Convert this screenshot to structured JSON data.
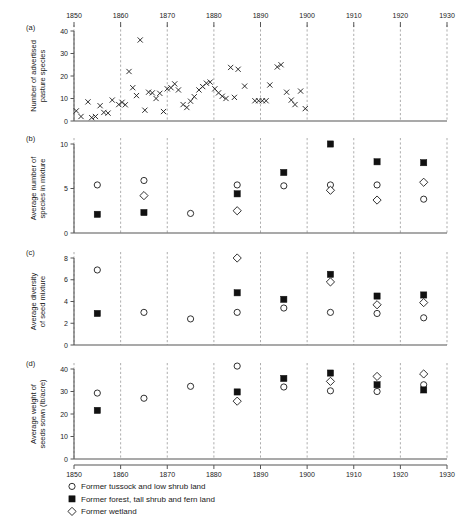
{
  "figure": {
    "panels": [
      "(a)",
      "(b)",
      "(c)",
      "(d)"
    ],
    "x_axis": {
      "label": "",
      "min": 1850,
      "max": 1930,
      "ticks": [
        1850,
        1860,
        1870,
        1880,
        1890,
        1900,
        1910,
        1920,
        1930
      ],
      "tick_labels": [
        "1850",
        "1860",
        "1870",
        "1880",
        "1890",
        "1900",
        "1910",
        "1920",
        "1930"
      ],
      "top_axis": true,
      "bottom_axis": true,
      "gridlines": "dashed vertical at every decade"
    },
    "legend": {
      "position": "below-bottom-axis",
      "entries": [
        {
          "marker": "open-circle",
          "label": "Former tussock and low shrub land"
        },
        {
          "marker": "filled-square",
          "label": "Former forest, tall shrub and fern land"
        },
        {
          "marker": "open-diamond",
          "label": "Former wetland"
        }
      ]
    }
  },
  "chart_data": [
    {
      "type": "scatter",
      "panel": "(a)",
      "title": "",
      "xlabel": "",
      "ylabel": "Number of advertised pasture species",
      "xlim": [
        1850,
        1930
      ],
      "ylim": [
        0,
        40
      ],
      "yticks": [
        0,
        10,
        20,
        30,
        40
      ],
      "ytick_labels": [
        "0",
        "10",
        "20",
        "30",
        "40"
      ],
      "grid": "vertical dashed decade lines",
      "legend": "none",
      "series": [
        {
          "name": "Advertised pasture species",
          "marker": "cross",
          "points": [
            [
              1850.5,
              4.5
            ],
            [
              1851.5,
              2.0
            ],
            [
              1853.0,
              8.5
            ],
            [
              1853.8,
              1.5
            ],
            [
              1854.6,
              2.0
            ],
            [
              1855.6,
              6.8
            ],
            [
              1856.4,
              3.8
            ],
            [
              1857.3,
              3.5
            ],
            [
              1858.2,
              9.3
            ],
            [
              1859.6,
              7.3
            ],
            [
              1860.3,
              8.3
            ],
            [
              1861.0,
              7.2
            ],
            [
              1861.8,
              22.0
            ],
            [
              1862.6,
              14.8
            ],
            [
              1863.4,
              11.3
            ],
            [
              1864.2,
              36.0
            ],
            [
              1865.2,
              4.8
            ],
            [
              1866.0,
              12.8
            ],
            [
              1866.8,
              12.5
            ],
            [
              1867.6,
              10.0
            ],
            [
              1868.4,
              12.3
            ],
            [
              1869.2,
              4.2
            ],
            [
              1870.0,
              14.3
            ],
            [
              1870.8,
              14.8
            ],
            [
              1871.6,
              16.5
            ],
            [
              1872.4,
              13.8
            ],
            [
              1873.4,
              7.3
            ],
            [
              1874.2,
              6.0
            ],
            [
              1875.0,
              8.8
            ],
            [
              1875.8,
              10.8
            ],
            [
              1876.8,
              13.8
            ],
            [
              1877.6,
              15.3
            ],
            [
              1878.4,
              16.8
            ],
            [
              1879.2,
              17.3
            ],
            [
              1880.2,
              14.3
            ],
            [
              1881.0,
              12.5
            ],
            [
              1881.8,
              11.0
            ],
            [
              1882.6,
              10.0
            ],
            [
              1883.6,
              23.8
            ],
            [
              1884.4,
              10.5
            ],
            [
              1885.2,
              23.0
            ],
            [
              1886.6,
              15.5
            ],
            [
              1888.8,
              9.0
            ],
            [
              1889.6,
              9.0
            ],
            [
              1890.4,
              9.0
            ],
            [
              1891.2,
              9.0
            ],
            [
              1892.0,
              16.0
            ],
            [
              1893.6,
              24.0
            ],
            [
              1894.4,
              25.0
            ],
            [
              1895.6,
              12.8
            ],
            [
              1896.6,
              9.3
            ],
            [
              1897.4,
              7.3
            ],
            [
              1898.6,
              13.3
            ],
            [
              1899.6,
              5.5
            ]
          ]
        }
      ]
    },
    {
      "type": "scatter",
      "panel": "(b)",
      "title": "",
      "xlabel": "",
      "ylabel": "Average number of species in mixture",
      "xlim": [
        1850,
        1930
      ],
      "ylim": [
        0,
        10
      ],
      "yticks": [
        0,
        5,
        10
      ],
      "ytick_labels": [
        "0",
        "5",
        "10"
      ],
      "grid": "vertical dashed decade lines",
      "series": [
        {
          "name": "Former tussock and low shrub land",
          "marker": "open-circle",
          "points": [
            [
              1855,
              5.4
            ],
            [
              1865,
              5.9
            ],
            [
              1875,
              2.2
            ],
            [
              1885,
              5.4
            ],
            [
              1895,
              5.3
            ],
            [
              1905,
              5.4
            ],
            [
              1915,
              5.4
            ],
            [
              1925,
              3.8
            ]
          ]
        },
        {
          "name": "Former forest, tall shrub and fern land",
          "marker": "filled-square",
          "points": [
            [
              1855,
              2.1
            ],
            [
              1865,
              2.3
            ],
            [
              1885,
              4.4
            ],
            [
              1895,
              6.8
            ],
            [
              1905,
              10.0
            ],
            [
              1915,
              8.0
            ],
            [
              1925,
              7.9
            ]
          ]
        },
        {
          "name": "Former wetland",
          "marker": "open-diamond",
          "points": [
            [
              1865,
              4.2
            ],
            [
              1885,
              2.5
            ],
            [
              1905,
              4.8
            ],
            [
              1915,
              3.7
            ],
            [
              1925,
              5.7
            ]
          ]
        }
      ]
    },
    {
      "type": "scatter",
      "panel": "(c)",
      "title": "",
      "xlabel": "",
      "ylabel": "Average diversity of seed mixture",
      "xlim": [
        1850,
        1930
      ],
      "ylim": [
        0,
        8
      ],
      "yticks": [
        0,
        2,
        4,
        6,
        8
      ],
      "ytick_labels": [
        "0",
        "2",
        "4",
        "6",
        "8"
      ],
      "grid": "vertical dashed decade lines",
      "series": [
        {
          "name": "Former tussock and low shrub land",
          "marker": "open-circle",
          "points": [
            [
              1855,
              6.9
            ],
            [
              1865,
              3.0
            ],
            [
              1875,
              2.4
            ],
            [
              1885,
              3.0
            ],
            [
              1895,
              3.4
            ],
            [
              1905,
              3.0
            ],
            [
              1915,
              2.9
            ],
            [
              1925,
              2.5
            ]
          ]
        },
        {
          "name": "Former forest, tall shrub and fern land",
          "marker": "filled-square",
          "points": [
            [
              1855,
              2.9
            ],
            [
              1885,
              4.8
            ],
            [
              1895,
              4.2
            ],
            [
              1905,
              6.5
            ],
            [
              1915,
              4.5
            ],
            [
              1925,
              4.6
            ]
          ]
        },
        {
          "name": "Former wetland",
          "marker": "open-diamond",
          "points": [
            [
              1885,
              8.0
            ],
            [
              1905,
              5.8
            ],
            [
              1915,
              3.7
            ],
            [
              1925,
              3.9
            ]
          ]
        }
      ]
    },
    {
      "type": "scatter",
      "panel": "(d)",
      "title": "",
      "xlabel": "",
      "ylabel": "Average weight of seeds sown (lb/acre)",
      "xlim": [
        1850,
        1930
      ],
      "ylim": [
        0,
        40
      ],
      "yticks": [
        0,
        10,
        20,
        30,
        40
      ],
      "ytick_labels": [
        "0",
        "10",
        "20",
        "30",
        "40"
      ],
      "grid": "vertical dashed decade lines",
      "series": [
        {
          "name": "Former tussock and low shrub land",
          "marker": "open-circle",
          "points": [
            [
              1855,
              29.3
            ],
            [
              1865,
              27.0
            ],
            [
              1875,
              32.3
            ],
            [
              1885,
              41.3
            ],
            [
              1895,
              32.0
            ],
            [
              1905,
              30.3
            ],
            [
              1915,
              30.0
            ],
            [
              1925,
              33.0
            ]
          ]
        },
        {
          "name": "Former forest, tall shrub and fern land",
          "marker": "filled-square",
          "points": [
            [
              1855,
              21.6
            ],
            [
              1885,
              29.8
            ],
            [
              1895,
              35.8
            ],
            [
              1905,
              38.2
            ],
            [
              1915,
              33.0
            ],
            [
              1925,
              30.7
            ]
          ]
        },
        {
          "name": "Former wetland",
          "marker": "open-diamond",
          "points": [
            [
              1885,
              25.7
            ],
            [
              1905,
              34.5
            ],
            [
              1915,
              36.7
            ],
            [
              1925,
              37.8
            ]
          ]
        }
      ]
    }
  ]
}
